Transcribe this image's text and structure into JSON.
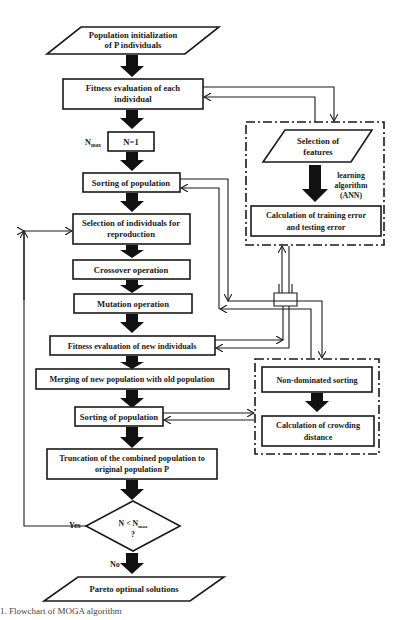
{
  "flowchart": {
    "start": {
      "line1": "Population initialization",
      "line2": "of P individuals"
    },
    "fitness_each": {
      "line1": "Fitness evaluation of each",
      "line2": "individual"
    },
    "nmax_label": "N",
    "nmax_sub": "max",
    "n_init": "N=1",
    "sorting1": "Sorting of population",
    "selection": {
      "line1": "Selection of individuals for",
      "line2": "reproduction"
    },
    "crossover": "Crossover operation",
    "mutation": "Mutation operation",
    "fitness_new": "Fitness evaluation of new individuals",
    "merging": "Merging of new population with old population",
    "sorting2": "Sorting of population",
    "truncation": {
      "line1": "Truncation of the combined population to",
      "line2": "original population P"
    },
    "decision": {
      "line1": "N < N",
      "sub": "max",
      "line2": "?"
    },
    "yes_label": "Yes",
    "no_label": "No",
    "end": "Pareto optimal solutions"
  },
  "ann_panel": {
    "features": {
      "line1": "Selection of",
      "line2": "features"
    },
    "algorithm": {
      "line1": "learning",
      "line2": "algorithm",
      "line3": "(ANN)"
    },
    "error": {
      "line1": "Calculation of training error",
      "line2": "and testing error"
    }
  },
  "nsga_panel": {
    "nondominated": "Non-dominated sorting",
    "crowding": {
      "line1": "Calculation of crowding",
      "line2": "distance"
    }
  },
  "caption": "1. Flowchart of MOGA algorithm"
}
